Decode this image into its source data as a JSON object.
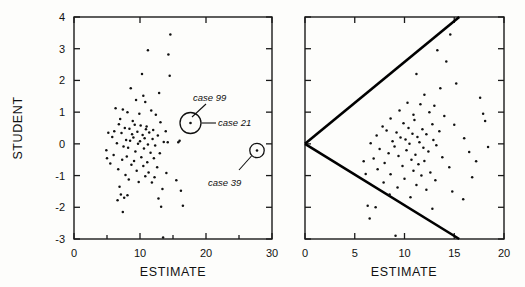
{
  "figure": {
    "title": "",
    "background_color": "#fdfdfb",
    "ink_color": "#111111"
  },
  "chart_data": [
    {
      "type": "scatter",
      "panel": "left",
      "title": "",
      "xlabel": "ESTIMATE",
      "ylabel": "STUDENT",
      "xlim": [
        0,
        30
      ],
      "ylim": [
        -3,
        4
      ],
      "xticks": [
        0,
        10,
        20,
        30
      ],
      "xtick_labels": [
        "0",
        "10",
        "20",
        "30"
      ],
      "yticks": [
        -3,
        -2,
        -1,
        0,
        1,
        2,
        3,
        4
      ],
      "ytick_labels": [
        "-3",
        "-2",
        "-1",
        "0",
        "1",
        "2",
        "3",
        "4"
      ],
      "grid": false,
      "legend": "none",
      "minor_xticks": [
        5,
        15,
        25
      ],
      "points": [
        [
          14.6,
          3.45
        ],
        [
          11.2,
          2.95
        ],
        [
          14.3,
          2.82
        ],
        [
          10.3,
          2.2
        ],
        [
          14.5,
          2.15
        ],
        [
          8.6,
          1.75
        ],
        [
          12.9,
          1.6
        ],
        [
          10.5,
          1.52
        ],
        [
          9.4,
          1.38
        ],
        [
          10.8,
          1.32
        ],
        [
          6.3,
          1.12
        ],
        [
          7.4,
          1.08
        ],
        [
          11.7,
          1.05
        ],
        [
          8.1,
          1.0
        ],
        [
          9.9,
          0.95
        ],
        [
          12.4,
          0.92
        ],
        [
          7.0,
          0.78
        ],
        [
          8.9,
          0.72
        ],
        [
          13.1,
          0.68
        ],
        [
          6.8,
          0.62
        ],
        [
          9.2,
          0.6
        ],
        [
          10.1,
          0.58
        ],
        [
          11.0,
          0.55
        ],
        [
          7.7,
          0.5
        ],
        [
          8.4,
          0.48
        ],
        [
          10.9,
          0.46
        ],
        [
          12.0,
          0.44
        ],
        [
          6.1,
          0.4
        ],
        [
          9.6,
          0.38
        ],
        [
          11.4,
          0.36
        ],
        [
          7.2,
          0.34
        ],
        [
          8.8,
          0.3
        ],
        [
          10.4,
          0.28
        ],
        [
          12.7,
          0.26
        ],
        [
          5.8,
          0.22
        ],
        [
          9.0,
          0.2
        ],
        [
          10.7,
          0.18
        ],
        [
          11.9,
          0.15
        ],
        [
          7.9,
          0.12
        ],
        [
          8.5,
          0.1
        ],
        [
          10.0,
          0.08
        ],
        [
          13.6,
          0.06
        ],
        [
          14.2,
          0.05
        ],
        [
          6.5,
          0.02
        ],
        [
          9.7,
          0.0
        ],
        [
          11.2,
          -0.02
        ],
        [
          12.3,
          -0.05
        ],
        [
          7.5,
          -0.08
        ],
        [
          8.2,
          -0.12
        ],
        [
          10.6,
          -0.15
        ],
        [
          4.9,
          -0.2
        ],
        [
          9.3,
          -0.24
        ],
        [
          11.6,
          -0.28
        ],
        [
          13.0,
          -0.3
        ],
        [
          6.0,
          -0.35
        ],
        [
          8.0,
          -0.4
        ],
        [
          10.2,
          -0.42
        ],
        [
          12.1,
          -0.45
        ],
        [
          7.3,
          -0.5
        ],
        [
          9.1,
          -0.54
        ],
        [
          11.1,
          -0.58
        ],
        [
          5.5,
          -0.62
        ],
        [
          8.7,
          -0.66
        ],
        [
          10.5,
          -0.7
        ],
        [
          12.6,
          -0.74
        ],
        [
          6.7,
          -0.8
        ],
        [
          9.5,
          -0.85
        ],
        [
          11.3,
          -0.9
        ],
        [
          14.0,
          -0.92
        ],
        [
          7.8,
          -0.98
        ],
        [
          10.8,
          -1.02
        ],
        [
          12.2,
          -1.05
        ],
        [
          8.3,
          -1.12
        ],
        [
          15.5,
          -1.15
        ],
        [
          9.8,
          -1.2
        ],
        [
          11.8,
          -1.22
        ],
        [
          6.9,
          -1.35
        ],
        [
          13.4,
          -1.42
        ],
        [
          16.2,
          -1.48
        ],
        [
          7.1,
          -1.6
        ],
        [
          8.1,
          -1.62
        ],
        [
          7.6,
          -1.7
        ],
        [
          12.8,
          -1.72
        ],
        [
          6.6,
          -1.78
        ],
        [
          16.5,
          -1.95
        ],
        [
          13.2,
          -1.98
        ],
        [
          7.4,
          -2.15
        ],
        [
          13.5,
          -2.95
        ],
        [
          16.0,
          0.1
        ],
        [
          15.8,
          0.05
        ],
        [
          5.2,
          0.35
        ],
        [
          5.0,
          -0.45
        ],
        [
          13.9,
          0.4
        ]
      ],
      "annotations": [
        {
          "label": "case 99",
          "kind": "callout-text"
        },
        {
          "label": "case 21",
          "kind": "callout-text"
        },
        {
          "label": "case 39",
          "kind": "callout-text"
        }
      ],
      "highlighted_points": [
        {
          "labels": [
            "case 99",
            "case 21"
          ],
          "x": 18.0,
          "y": 0.35,
          "circled": true
        },
        {
          "labels": [
            "case 39"
          ],
          "x": 27.8,
          "y": -0.5,
          "circled": true
        }
      ]
    },
    {
      "type": "scatter",
      "panel": "right",
      "title": "",
      "xlabel": "ESTIMATE",
      "ylabel": "",
      "xlim": [
        0,
        20
      ],
      "ylim": [
        -3,
        4
      ],
      "xticks": [
        0,
        5,
        10,
        15,
        20
      ],
      "xtick_labels": [
        "0",
        "5",
        "10",
        "15",
        "20"
      ],
      "yticks": [
        -3,
        -2,
        -1,
        0,
        1,
        2,
        3,
        4
      ],
      "ytick_labels": [
        "",
        "",
        "",
        "",
        "",
        "",
        "",
        ""
      ],
      "grid": false,
      "legend": "none",
      "reference_lines": [
        {
          "name": "upper-envelope",
          "from": [
            0,
            0.0
          ],
          "to": [
            15.5,
            4.0
          ]
        },
        {
          "name": "lower-envelope",
          "from": [
            0,
            0.0
          ],
          "to": [
            15.5,
            -3.0
          ]
        }
      ],
      "points": [
        [
          14.6,
          3.45
        ],
        [
          13.3,
          2.95
        ],
        [
          14.2,
          2.6
        ],
        [
          11.2,
          2.2
        ],
        [
          15.2,
          1.9
        ],
        [
          12.0,
          1.55
        ],
        [
          17.6,
          1.45
        ],
        [
          10.3,
          1.3
        ],
        [
          11.6,
          1.25
        ],
        [
          13.0,
          1.2
        ],
        [
          9.5,
          1.05
        ],
        [
          12.5,
          1.0
        ],
        [
          10.9,
          0.92
        ],
        [
          14.0,
          0.88
        ],
        [
          8.6,
          0.8
        ],
        [
          11.0,
          0.75
        ],
        [
          18.1,
          0.72
        ],
        [
          9.9,
          0.65
        ],
        [
          12.8,
          0.62
        ],
        [
          7.8,
          0.55
        ],
        [
          10.4,
          0.5
        ],
        [
          11.8,
          0.46
        ],
        [
          8.2,
          0.42
        ],
        [
          13.5,
          0.4
        ],
        [
          9.2,
          0.36
        ],
        [
          10.8,
          0.32
        ],
        [
          12.2,
          0.3
        ],
        [
          7.2,
          0.26
        ],
        [
          11.3,
          0.22
        ],
        [
          9.6,
          0.2
        ],
        [
          16.0,
          0.18
        ],
        [
          10.1,
          0.14
        ],
        [
          12.9,
          0.12
        ],
        [
          8.8,
          0.08
        ],
        [
          11.5,
          0.05
        ],
        [
          6.6,
          0.02
        ],
        [
          10.5,
          0.0
        ],
        [
          13.2,
          -0.04
        ],
        [
          9.0,
          -0.08
        ],
        [
          11.9,
          -0.12
        ],
        [
          7.5,
          -0.16
        ],
        [
          10.2,
          -0.2
        ],
        [
          12.4,
          -0.24
        ],
        [
          16.5,
          -0.26
        ],
        [
          8.4,
          -0.3
        ],
        [
          11.1,
          -0.34
        ],
        [
          9.4,
          -0.38
        ],
        [
          13.8,
          -0.42
        ],
        [
          6.9,
          -0.46
        ],
        [
          10.7,
          -0.5
        ],
        [
          12.0,
          -0.54
        ],
        [
          8.0,
          -0.6
        ],
        [
          11.4,
          -0.64
        ],
        [
          9.8,
          -0.7
        ],
        [
          14.5,
          -0.74
        ],
        [
          7.3,
          -0.8
        ],
        [
          10.9,
          -0.85
        ],
        [
          12.6,
          -0.9
        ],
        [
          8.6,
          -0.96
        ],
        [
          11.7,
          -1.0
        ],
        [
          16.8,
          -1.05
        ],
        [
          10.0,
          -1.1
        ],
        [
          13.1,
          -1.15
        ],
        [
          7.9,
          -1.22
        ],
        [
          11.2,
          -1.3
        ],
        [
          9.3,
          -1.38
        ],
        [
          12.2,
          -1.45
        ],
        [
          14.8,
          -1.5
        ],
        [
          8.5,
          -1.6
        ],
        [
          10.6,
          -1.68
        ],
        [
          15.9,
          -1.75
        ],
        [
          6.3,
          -1.95
        ],
        [
          7.1,
          -2.0
        ],
        [
          12.8,
          -2.05
        ],
        [
          6.5,
          -2.35
        ],
        [
          9.1,
          -2.9
        ],
        [
          17.2,
          -0.55
        ],
        [
          18.4,
          -0.1
        ],
        [
          5.9,
          -0.55
        ],
        [
          6.1,
          -0.95
        ],
        [
          15.0,
          0.6
        ],
        [
          13.6,
          1.75
        ],
        [
          17.9,
          0.95
        ]
      ]
    }
  ],
  "labels": {
    "left_xlabel": "ESTIMATE",
    "left_ylabel": "STUDENT",
    "right_xlabel": "ESTIMATE",
    "case_99": "case 99",
    "case_21": "case 21",
    "case_39": "case 39"
  }
}
